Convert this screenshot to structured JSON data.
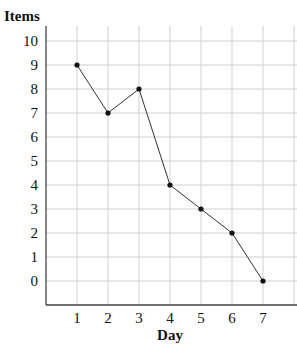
{
  "chart_data": {
    "type": "line",
    "title": "",
    "xlabel": "Day",
    "ylabel": "Items",
    "categories": [
      1,
      2,
      3,
      4,
      5,
      6,
      7
    ],
    "x": [
      1,
      2,
      3,
      4,
      5,
      6,
      7
    ],
    "series": [
      {
        "name": "Items",
        "values": [
          9,
          7,
          8,
          4,
          3,
          2,
          0
        ]
      }
    ],
    "xticks": [
      "1",
      "2",
      "3",
      "4",
      "5",
      "6",
      "7"
    ],
    "yticks": [
      "0",
      "1",
      "2",
      "3",
      "4",
      "5",
      "6",
      "7",
      "8",
      "9",
      "10"
    ],
    "xlim": [
      0,
      7.7
    ],
    "ylim": [
      -1,
      10.6
    ],
    "grid": true,
    "legend": null
  },
  "labels": {
    "x": "Day",
    "y": "Items"
  },
  "colors": {
    "line": "#333333",
    "grid": "#cfcfcf",
    "axis": "#444444"
  }
}
